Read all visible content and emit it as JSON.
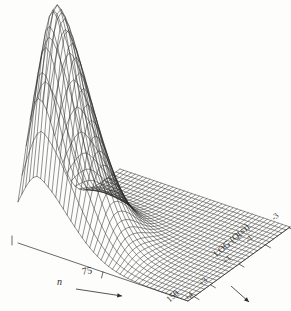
{
  "figure": {
    "kind": "3d-wireframe-surface",
    "background_color": "#fdfdfb",
    "line_color": "#262626",
    "title": "",
    "caption": ""
  },
  "axes": {
    "x": {
      "label": "n",
      "label_has_arrow": true,
      "arrow_glyph": "→",
      "ticks": [
        "75",
        "150"
      ],
      "range": [
        0,
        150
      ]
    },
    "y": {
      "label": "LOG (Q(s))",
      "label_has_arrow": true,
      "arrow_glyph": "→",
      "ticks": [
        "+4",
        "+3",
        "+1",
        "-1",
        "-3"
      ],
      "range": [
        4,
        -3
      ]
    },
    "z": {
      "label": "",
      "ticks": []
    }
  },
  "chart_data": {
    "type": "surface",
    "title": "",
    "xlabel": "n",
    "ylabel": "LOG (Q(s))",
    "zlabel": "",
    "xlim": [
      0,
      150
    ],
    "ylim": [
      4,
      -3
    ],
    "zlim": [
      0,
      1
    ],
    "grid": false,
    "legend": null,
    "x_ticks": [
      75,
      150
    ],
    "x_tick_labels": [
      "75",
      "150"
    ],
    "y_ticks": [
      4,
      3,
      1,
      -1,
      -3
    ],
    "y_tick_labels": [
      "+4",
      "+3",
      "+1",
      "-1",
      "-3"
    ],
    "peak": {
      "x": 18,
      "y": 3.3,
      "z": 1.0
    },
    "mesh": {
      "nx": 46,
      "ny": 26
    },
    "model": {
      "form": "z = exp(-((x-xp)/wx)^2 * k) * exp(-((y-yp)/wy)^2)",
      "xp": 0.12,
      "wx": 0.3,
      "yp": 0.18,
      "wy": 0.26
    }
  }
}
